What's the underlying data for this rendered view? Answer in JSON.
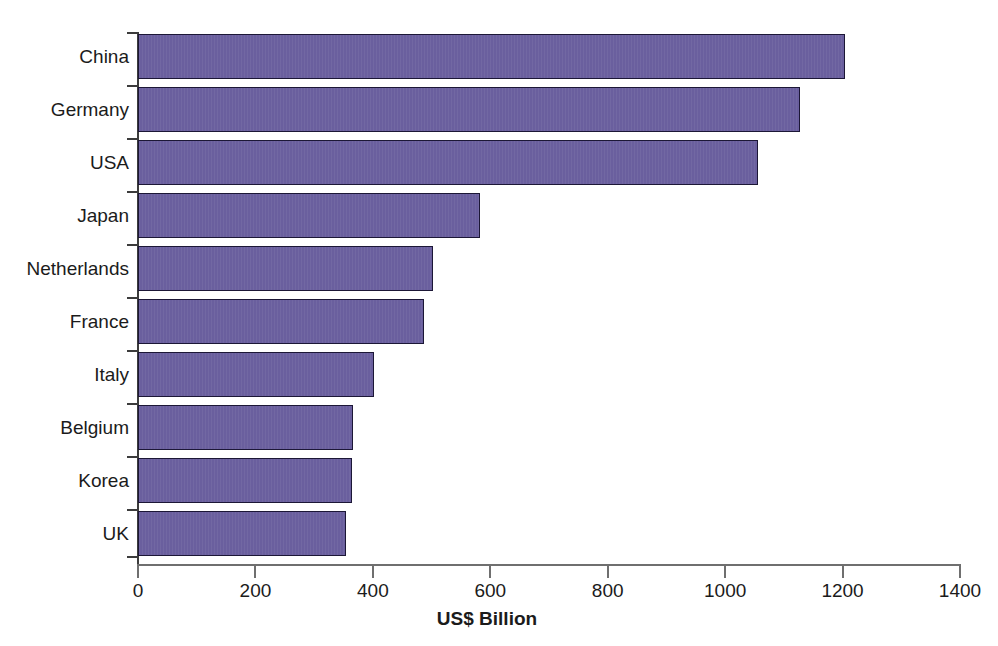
{
  "chart_data": {
    "type": "bar",
    "orientation": "horizontal",
    "title": "",
    "categories": [
      "China",
      "Germany",
      "USA",
      "Japan",
      "Netherlands",
      "France",
      "Italy",
      "Belgium",
      "Korea",
      "UK"
    ],
    "values": [
      1204,
      1128,
      1056,
      583,
      503,
      487,
      402,
      366,
      364,
      354
    ],
    "xlabel": "US$ Billion",
    "ylabel": "",
    "xlim": [
      0,
      1400
    ],
    "xticks": [
      0,
      200,
      400,
      600,
      800,
      1000,
      1200,
      1400
    ],
    "xtick_labels": [
      "0",
      "200",
      "400",
      "600",
      "800",
      "1000",
      "1200",
      "1400"
    ],
    "grid": false,
    "legend": null,
    "bar_color": "#6a5f9e",
    "bar_edge_color": "#1c1736",
    "background_color": "#ffffff",
    "axis_color": "#6f6f6f"
  },
  "axis": {
    "x_title": "US$ Billion"
  }
}
